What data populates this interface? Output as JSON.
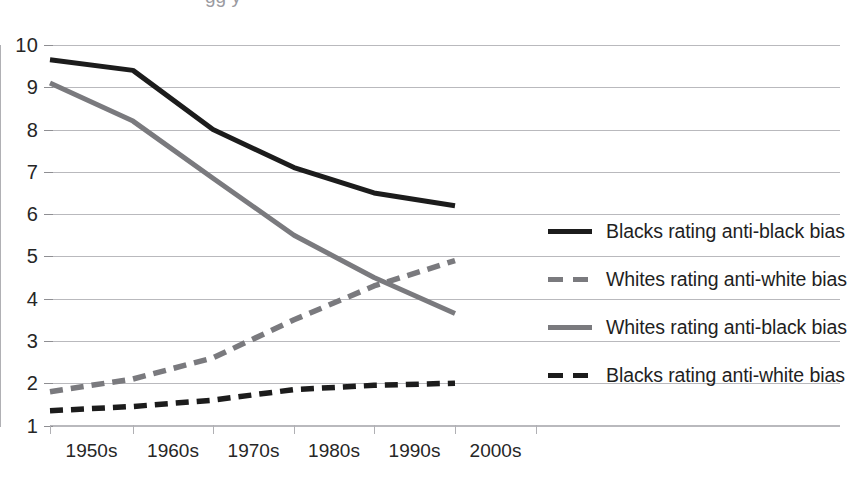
{
  "chart_data": {
    "type": "line",
    "title": "",
    "xlabel": "",
    "ylabel": "",
    "categories": [
      "1950s",
      "1960s",
      "1970s",
      "1980s",
      "1990s",
      "2000s"
    ],
    "ylim": [
      1,
      10
    ],
    "yticks": [
      1,
      2,
      3,
      4,
      5,
      6,
      7,
      8,
      9,
      10
    ],
    "grid": true,
    "legend_position": "right",
    "series": [
      {
        "name": "Blacks rating anti-black bias",
        "style": "solid",
        "color": "#1c1c1c",
        "values": [
          9.65,
          9.4,
          8.0,
          7.1,
          6.5,
          6.2
        ]
      },
      {
        "name": "Whites rating anti-white bias",
        "style": "dashed",
        "color": "#7a7a7e",
        "values": [
          1.8,
          2.1,
          2.6,
          3.5,
          4.3,
          4.9
        ]
      },
      {
        "name": "Whites rating anti-black bias",
        "style": "solid",
        "color": "#7a7a7e",
        "values": [
          9.1,
          8.2,
          6.85,
          5.5,
          4.5,
          3.65
        ]
      },
      {
        "name": "Blacks rating anti-white bias",
        "style": "dashed",
        "color": "#1c1c1c",
        "values": [
          1.35,
          1.45,
          1.6,
          1.85,
          1.95,
          2.0
        ]
      }
    ]
  },
  "axes": {
    "y_tick_labels": [
      "10",
      "9",
      "8",
      "7",
      "6",
      "5",
      "4",
      "3",
      "2",
      "1"
    ],
    "x_tick_labels": [
      "1950s",
      "1960s",
      "1970s",
      "1980s",
      "1990s",
      "2000s"
    ]
  },
  "legend": {
    "entries": [
      {
        "label": "Blacks rating anti-black bias",
        "swatch": "solid-black-line-icon"
      },
      {
        "label": "Whites rating anti-white bias",
        "swatch": "dashed-gray-line-icon"
      },
      {
        "label": "Whites rating anti-black bias",
        "swatch": "solid-gray-line-icon"
      },
      {
        "label": "Blacks rating anti-white bias",
        "swatch": "dashed-black-line-icon"
      }
    ]
  },
  "artifacts": {
    "top_clipped_text": "gg  y"
  }
}
